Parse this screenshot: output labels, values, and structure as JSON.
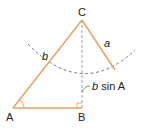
{
  "diagram": {
    "vertices": {
      "A": {
        "label": "A"
      },
      "B": {
        "label": "B"
      },
      "C": {
        "label": "C"
      }
    },
    "sides": {
      "b": {
        "label": "b"
      },
      "a": {
        "label": "a"
      }
    },
    "height_label": {
      "var": "b",
      "rest": " sin A"
    },
    "colors": {
      "line": "#e6a15c",
      "dash": "#777777",
      "text": "#222222"
    }
  }
}
